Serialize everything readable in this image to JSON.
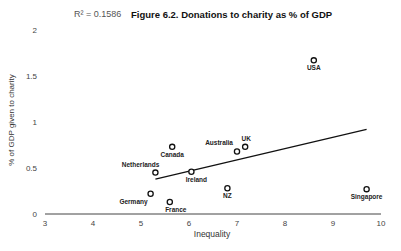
{
  "chart_data": {
    "type": "scatter",
    "title": "Figure 6.2. Donations to charity as % of GDP",
    "annotation": "R² = 0.1586",
    "xlabel": "Inequality",
    "ylabel": "% of GDP given to charity",
    "xlim": [
      3,
      10
    ],
    "ylim": [
      0,
      2
    ],
    "xticks": [
      "3",
      "4",
      "5",
      "6",
      "7",
      "8",
      "9",
      "10"
    ],
    "yticks": [
      "0",
      "0.5",
      "1",
      "1.5",
      "2"
    ],
    "grid": false,
    "legend": null,
    "points": [
      {
        "label": "USA",
        "x": 8.6,
        "y": 1.67
      },
      {
        "label": "Canada",
        "x": 5.65,
        "y": 0.73
      },
      {
        "label": "UK",
        "x": 7.17,
        "y": 0.73
      },
      {
        "label": "Australia",
        "x": 7.0,
        "y": 0.68
      },
      {
        "label": "Netherlands",
        "x": 5.3,
        "y": 0.45
      },
      {
        "label": "Ireland",
        "x": 6.05,
        "y": 0.46
      },
      {
        "label": "NZ",
        "x": 6.8,
        "y": 0.28
      },
      {
        "label": "Singapore",
        "x": 9.7,
        "y": 0.27
      },
      {
        "label": "Germany",
        "x": 5.2,
        "y": 0.22
      },
      {
        "label": "France",
        "x": 5.6,
        "y": 0.13
      }
    ],
    "trendline": {
      "type": "linear",
      "x": [
        5.3,
        9.7
      ],
      "y": [
        0.38,
        0.92
      ],
      "r_squared": 0.1586
    }
  }
}
